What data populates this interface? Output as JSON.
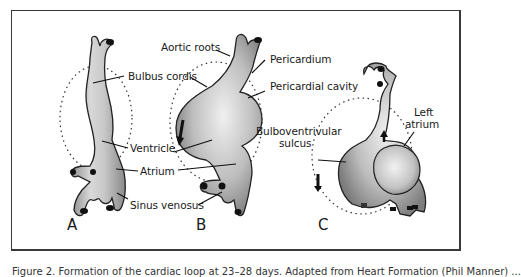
{
  "figure": {
    "panels": [
      {
        "id": "A",
        "letter": "A"
      },
      {
        "id": "B",
        "letter": "B"
      },
      {
        "id": "C",
        "letter": "C"
      }
    ],
    "labels": {
      "bulbus_cordis": "Bulbus cordis",
      "aortic_roots": "Aortic roots",
      "pericardium": "Pericardium",
      "pericardial_cavity": "Pericardial cavity",
      "ventricle": "Ventricle",
      "atrium": "Atrium",
      "sinus_venosus": "Sinus venosus",
      "bulboventricular_sulcus_1": "Bulboventrivular",
      "bulboventricular_sulcus_2": "sulcus",
      "left_atrium_1": "Left",
      "left_atrium_2": "atrium"
    },
    "caption": "Figure 2. Formation of the cardiac loop at 23–28 days. Adapted from Heart Formation (Phil Manner) ...",
    "colors": {
      "frame": "#3a3a3a",
      "tissue_light": "#e6e6e6",
      "tissue_dark": "#9a9a9a",
      "outline": "#222222"
    }
  }
}
